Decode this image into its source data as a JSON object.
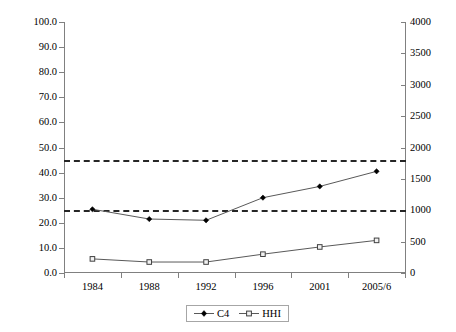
{
  "chart_data": {
    "type": "line",
    "title": "",
    "xlabel": "",
    "ylabel": "",
    "categories": [
      "1984",
      "1988",
      "1992",
      "1996",
      "2001",
      "2005/6"
    ],
    "series": [
      {
        "name": "C4",
        "axis": "left",
        "marker": "filled-diamond",
        "values": [
          25.4,
          21.5,
          21.0,
          30.0,
          34.5,
          40.5
        ]
      },
      {
        "name": "HHI",
        "axis": "right",
        "marker": "open-square",
        "values": [
          225,
          175,
          175,
          300,
          415,
          520
        ]
      }
    ],
    "left_axis": {
      "ticks": [
        "0.0",
        "10.0",
        "20.0",
        "30.0",
        "40.0",
        "50.0",
        "60.0",
        "70.0",
        "80.0",
        "90.0",
        "100.0"
      ],
      "min": 0,
      "max": 100,
      "step": 10
    },
    "right_axis": {
      "ticks": [
        "0",
        "500",
        "1000",
        "1500",
        "2000",
        "2500",
        "3000",
        "3500",
        "4000"
      ],
      "min": 0,
      "max": 4000,
      "step": 500
    },
    "threshold_lines": [
      {
        "name": "upper-threshold",
        "left_value": 45,
        "right_value": 1800
      },
      {
        "name": "lower-threshold",
        "left_value": 25,
        "right_value": 1000
      }
    ],
    "legend": {
      "position": "bottom-center",
      "entries": [
        {
          "label": "C4",
          "marker": "filled-diamond"
        },
        {
          "label": "HHI",
          "marker": "open-square"
        }
      ]
    },
    "grid": false,
    "colors": {
      "series_line": "#595959",
      "axis": "#808080",
      "threshold": "#262626",
      "background": "#ffffff"
    }
  }
}
